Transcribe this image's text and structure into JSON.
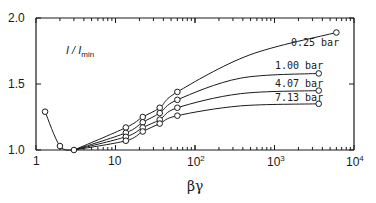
{
  "chart_data": {
    "type": "line",
    "title": "",
    "xlabel": "βγ",
    "ylabel": "I / I_min",
    "xscale": "log",
    "xlim": [
      1,
      10000
    ],
    "ylim": [
      1.0,
      2.0
    ],
    "grid": false,
    "legend_position": "inline labels at right end of curves",
    "x_ticks": [
      {
        "value": 1,
        "label": "1"
      },
      {
        "value": 10,
        "label": "10"
      },
      {
        "value": 100,
        "label": "10",
        "exp": "2"
      },
      {
        "value": 1000,
        "label": "10",
        "exp": "3"
      },
      {
        "value": 10000,
        "label": "10",
        "exp": "4"
      }
    ],
    "y_ticks": [
      {
        "value": 1.0,
        "label": "1.0"
      },
      {
        "value": 1.5,
        "label": "1.5"
      },
      {
        "value": 2.0,
        "label": "2.0"
      }
    ],
    "common_low_branch": {
      "x": [
        1.3,
        2.0,
        3.0
      ],
      "y": [
        1.29,
        1.03,
        1.0
      ]
    },
    "series": [
      {
        "name": "0.25 bar",
        "x": [
          3.0,
          13.5,
          22,
          36,
          60,
          6000
        ],
        "y": [
          1.0,
          1.17,
          1.25,
          1.32,
          1.44,
          1.89
        ]
      },
      {
        "name": "1.00 bar",
        "x": [
          3.0,
          13.5,
          22,
          36,
          60,
          3600
        ],
        "y": [
          1.0,
          1.13,
          1.21,
          1.28,
          1.38,
          1.58
        ]
      },
      {
        "name": "4.07 bar",
        "x": [
          3.0,
          13.5,
          22,
          36,
          60,
          3600
        ],
        "y": [
          1.0,
          1.1,
          1.17,
          1.23,
          1.32,
          1.45
        ]
      },
      {
        "name": "7.13 bar",
        "x": [
          3.0,
          13.5,
          22,
          36,
          60,
          3600
        ],
        "y": [
          1.0,
          1.07,
          1.14,
          1.2,
          1.26,
          1.35
        ]
      }
    ]
  },
  "labels": {
    "ylabel_main": "I / I",
    "ylabel_sub": "min",
    "xlabel": "βγ",
    "series": [
      "0.25  bar",
      "1.00  bar",
      "4.07  bar",
      "7.13  bar"
    ],
    "yticks": [
      "2.0",
      "1.5",
      "1.0"
    ],
    "xticks": [
      "1",
      "10",
      "10",
      "10",
      "10"
    ],
    "xtick_exps": [
      "",
      "",
      "2",
      "3",
      "4"
    ]
  }
}
